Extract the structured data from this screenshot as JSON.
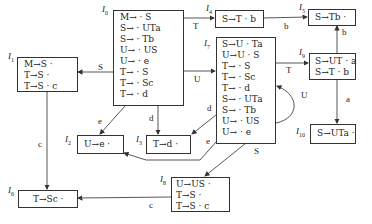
{
  "states": [
    {
      "id": "I0",
      "label": "I",
      "sub": "0",
      "items": [
        "M→ · S",
        "S→ · UTa",
        "S→ · Tb",
        "U→ · US",
        "U→ · e",
        "T→ · S",
        "T→ · Sc",
        "T→ · d"
      ]
    },
    {
      "id": "I1",
      "label": "I",
      "sub": "1",
      "items": [
        "M→S ·",
        "T→S ·",
        "T→S · c"
      ]
    },
    {
      "id": "I2",
      "label": "I",
      "sub": "2",
      "items": [
        "U→e ·"
      ]
    },
    {
      "id": "I3",
      "label": "I",
      "sub": "3",
      "items": [
        "T→d ·"
      ]
    },
    {
      "id": "I4",
      "label": "I",
      "sub": "4",
      "items": [
        "S→T · b"
      ]
    },
    {
      "id": "I5",
      "label": "I",
      "sub": "5",
      "items": [
        "S→Tb ·"
      ]
    },
    {
      "id": "I6",
      "label": "I",
      "sub": "6",
      "items": [
        "T→Sc ·"
      ]
    },
    {
      "id": "I7",
      "label": "I",
      "sub": "7",
      "items": [
        "S→U · Ta",
        "U→U · S",
        "T→ · S",
        "T→ · Sc",
        "T→ · d",
        "S→ · UTa",
        "S→ · Tb",
        "U→ · US",
        "U→ · e"
      ]
    },
    {
      "id": "I8",
      "label": "I",
      "sub": "8",
      "items": [
        "U→US ·",
        "T→S ·",
        "T→S · c"
      ]
    },
    {
      "id": "I9",
      "label": "I",
      "sub": "9",
      "items": [
        "S→UT · a",
        "S→T · b"
      ]
    },
    {
      "id": "I10",
      "label": "I",
      "sub": "10",
      "items": [
        "S→UTa ·"
      ]
    }
  ],
  "transitions": [
    {
      "from": "I0",
      "to": "I1",
      "symbol": "S"
    },
    {
      "from": "I0",
      "to": "I4",
      "symbol": "T"
    },
    {
      "from": "I0",
      "to": "I7",
      "symbol": "U"
    },
    {
      "from": "I0",
      "to": "I2",
      "symbol": "e"
    },
    {
      "from": "I0",
      "to": "I3",
      "symbol": "d"
    },
    {
      "from": "I1",
      "to": "I6",
      "symbol": "c"
    },
    {
      "from": "I4",
      "to": "I5",
      "symbol": "b"
    },
    {
      "from": "I7",
      "to": "I9",
      "symbol": "T"
    },
    {
      "from": "I7",
      "to": "I7",
      "symbol": "U"
    },
    {
      "from": "I7",
      "to": "I3",
      "symbol": "d"
    },
    {
      "from": "I7",
      "to": "I2",
      "symbol": "e"
    },
    {
      "from": "I7",
      "to": "I8",
      "symbol": "S"
    },
    {
      "from": "I9",
      "to": "I5",
      "symbol": "b"
    },
    {
      "from": "I9",
      "to": "I10",
      "symbol": "a"
    },
    {
      "from": "I8",
      "to": "I6",
      "symbol": "c"
    }
  ]
}
